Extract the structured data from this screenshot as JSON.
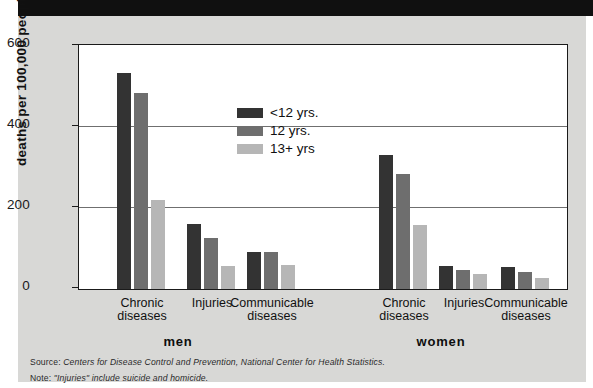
{
  "chart_data": {
    "type": "bar",
    "title": "",
    "xlabel": "",
    "ylabel": "deaths per 100,000 people",
    "ylim": [
      0,
      600
    ],
    "yticks": [
      "0",
      "200",
      "400",
      "600"
    ],
    "grid": true,
    "legend_position": "inside-top-left",
    "categories": [
      "Chronic diseases",
      "Injuries",
      "Communicable diseases",
      "Chronic diseases",
      "Injuries",
      "Communicable diseases"
    ],
    "supergroups": [
      "men",
      "women"
    ],
    "series": [
      {
        "name": "<12 yrs.",
        "color": "#333333",
        "values": [
          534,
          160,
          91,
          331,
          56,
          54
        ]
      },
      {
        "name": "12 yrs.",
        "color": "#6e6e6e",
        "values": [
          485,
          127,
          91,
          284,
          46,
          42
        ]
      },
      {
        "name": "13+ yrs",
        "color": "#b6b6b6",
        "values": [
          220,
          56,
          59,
          159,
          37,
          27
        ]
      }
    ]
  },
  "groups": [
    {
      "label_line1": "Chronic",
      "label_line2": "diseases",
      "super": "men"
    },
    {
      "label_line1": "Injuries",
      "label_line2": "",
      "super": "men"
    },
    {
      "label_line1": "Communicable",
      "label_line2": "diseases",
      "super": "men"
    },
    {
      "label_line1": "Chronic",
      "label_line2": "diseases",
      "super": "women"
    },
    {
      "label_line1": "Injuries",
      "label_line2": "",
      "super": "women"
    },
    {
      "label_line1": "Communicable",
      "label_line2": "diseases",
      "super": "women"
    }
  ],
  "supergroup_labels": {
    "men": "men",
    "women": "women"
  },
  "notes": {
    "source_prefix": "Source:",
    "source_text": "Centers for Disease Control and Prevention, National Center for Health Statistics.",
    "note_prefix": "Note:",
    "note_text": "\"Injuries\" include suicide and homicide."
  }
}
